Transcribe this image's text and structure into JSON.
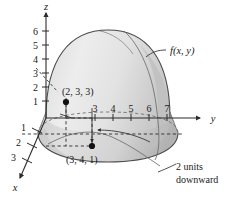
{
  "figure": {
    "kind": "3d-surface-diagram",
    "caption_elements": {
      "function_label": "f(x, y)",
      "note_line1": "2 units",
      "note_line2": "downward"
    },
    "axes": {
      "z": {
        "name": "z",
        "ticks": [
          "6",
          "5",
          "4",
          "3",
          "2",
          "1"
        ]
      },
      "y": {
        "name": "y",
        "ticks": [
          "3",
          "4",
          "5",
          "6",
          "7"
        ]
      },
      "x": {
        "name": "x",
        "ticks": [
          "1",
          "2",
          "3"
        ]
      }
    },
    "points": [
      {
        "label": "(2, 3, 3)",
        "coords": [
          2,
          3,
          3
        ]
      },
      {
        "label": "(3, 4, 1)",
        "coords": [
          3,
          4,
          1
        ]
      }
    ],
    "colors": {
      "surface_light": "#e6e6e6",
      "surface_mid": "#d5d5d5",
      "surface_dark": "#b9b9b9",
      "stroke": "#4a4a4a",
      "text": "#1a1a1a",
      "background": "#ffffff"
    }
  }
}
